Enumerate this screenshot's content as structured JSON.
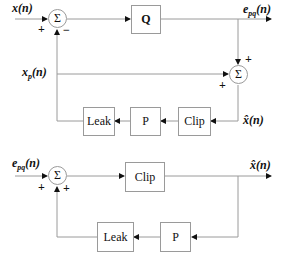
{
  "top_diagram": {
    "input_label": "x(n)",
    "input2_label_main": "x",
    "input2_label_sub": "p",
    "input2_label_arg": "(n)",
    "output_label_main": "e",
    "output_label_sub": "pq",
    "output_label_arg": "(n)",
    "feedback_label": "x̂(n)",
    "sum1": {
      "symbol": "Σ",
      "sign_left": "+",
      "sign_bottom": "−"
    },
    "sum2": {
      "symbol": "Σ",
      "sign_top": "+",
      "sign_left": "+"
    },
    "blocks": {
      "quantizer": "Q",
      "clip": "Clip",
      "p": "P",
      "leak": "Leak"
    }
  },
  "bottom_diagram": {
    "input_label_main": "e",
    "input_label_sub": "pq",
    "input_label_arg": "(n)",
    "output_label": "x̂(n)",
    "sum": {
      "symbol": "Σ",
      "sign_left": "+",
      "sign_bottom": "+"
    },
    "blocks": {
      "clip": "Clip",
      "p": "P",
      "leak": "Leak"
    }
  },
  "colors": {
    "line": "#9a9a9a",
    "arrow": "#111111",
    "text": "#111111"
  }
}
